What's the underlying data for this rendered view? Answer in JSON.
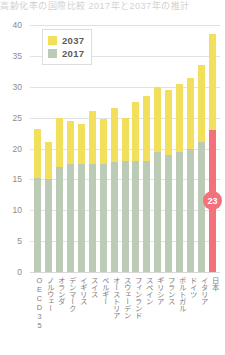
{
  "title_strip": "高齢化率の国際比較 2017年と2037年の推計",
  "legend": {
    "position": "top-left-inside",
    "items": [
      {
        "label": "2037",
        "color": "#f2e05c"
      },
      {
        "label": "2017",
        "color": "#bccbb6"
      }
    ]
  },
  "highlight": {
    "badge_value": "23",
    "badge_color": "#f2717a",
    "country": "日本"
  },
  "colors": {
    "series_2037": "#f2e05c",
    "series_2017": "#bccbb6",
    "highlight_2037": "#f2e05c",
    "highlight_2017": "#f2717a",
    "grid": "#e2e2e2",
    "axis_text": "#8c8c8c",
    "label_text": "#7d7d7d"
  },
  "chart_data": {
    "type": "bar",
    "subtype": "stacked",
    "title": "高齢化率の国際比較 2017年と2037年の推計",
    "xlabel": "",
    "ylabel": "",
    "ylim": [
      0,
      40
    ],
    "yticks": [
      0,
      5,
      10,
      15,
      20,
      25,
      30,
      35,
      40
    ],
    "grid": true,
    "legend_position": "top-left",
    "categories": [
      "OECD35",
      "ノルウェー",
      "オランダ",
      "デンマーク",
      "イギリス",
      "スイス",
      "ベルギー",
      "オーストリア",
      "スウェーデン",
      "フィンランド",
      "スペイン",
      "ギリシア",
      "フランス",
      "ポルトガル",
      "ドイツ",
      "イタリア",
      "日本"
    ],
    "series": [
      {
        "name": "2017",
        "color": "#bccbb6",
        "values": [
          15.2,
          15.0,
          17.0,
          17.5,
          17.5,
          17.5,
          17.5,
          17.8,
          18.0,
          18.0,
          18.0,
          19.5,
          19.0,
          19.5,
          20.0,
          21.0,
          23.0
        ]
      },
      {
        "name": "2037",
        "color": "#f2e05c",
        "values": [
          23.2,
          21.0,
          25.0,
          24.5,
          24.0,
          26.0,
          24.8,
          26.5,
          25.0,
          27.5,
          28.5,
          30.0,
          29.5,
          30.5,
          31.5,
          33.5,
          38.5
        ]
      }
    ]
  }
}
